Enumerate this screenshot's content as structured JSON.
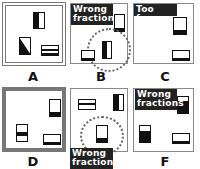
{
  "panels": [
    {
      "id": "A",
      "label": "A",
      "border": "double-thick",
      "tag": null
    },
    {
      "id": "B",
      "label": "B",
      "border": "thin",
      "tag": "Wrong fraction"
    },
    {
      "id": "C",
      "label": "C",
      "border": "thin",
      "tag": "Too few"
    },
    {
      "id": "D",
      "label": "D",
      "border": "thick",
      "tag": null
    },
    {
      "id": "E",
      "label": "",
      "border": "thin",
      "tag_line1": "Wrong",
      "tag_line2": "fraction"
    },
    {
      "id": "F",
      "label": "F",
      "border": "thin",
      "tag_line1": "Wrong",
      "tag_line2": "fractions"
    }
  ],
  "tags": {
    "B": {
      "line1": "Wrong",
      "line2": "fraction"
    },
    "C": {
      "line1": "Too few"
    },
    "E": {
      "line1": "Wrong",
      "line2": "fraction"
    },
    "F": {
      "line1": "Wrong",
      "line2": "fractions"
    }
  },
  "labels": {
    "A": "A",
    "B": "B",
    "C": "C",
    "D": "D",
    "F": "F"
  },
  "colors": {
    "tag_bg": "#222222",
    "frame": "#777777",
    "ink": "#111111"
  }
}
